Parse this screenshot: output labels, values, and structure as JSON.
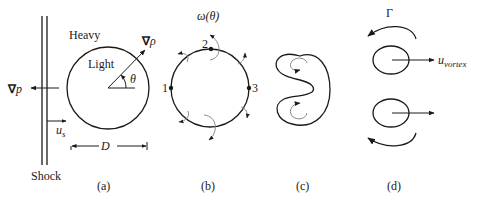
{
  "figure": {
    "panels": [
      {
        "id": "a",
        "label": "(a)"
      },
      {
        "id": "b",
        "label": "(b)"
      },
      {
        "id": "c",
        "label": "(c)"
      },
      {
        "id": "d",
        "label": "(d)"
      }
    ],
    "panel_a": {
      "shock_label": "Shock",
      "heavy_label": "Heavy",
      "light_label": "Light",
      "grad_p_symbol": "∇",
      "grad_p_var": "p",
      "grad_rho_symbol": "∇",
      "grad_rho_var": "ρ",
      "theta_label": "θ",
      "u_s_main": "u",
      "u_s_sub": "s",
      "diameter_label": "D"
    },
    "panel_b": {
      "vorticity_label": "ω(θ)",
      "points": [
        "1",
        "2",
        "3"
      ]
    },
    "panel_d": {
      "circulation_label": "Γ",
      "u_vortex_main": "u",
      "u_vortex_sub": "vortex"
    },
    "colors": {
      "ink": "#1a1a1a",
      "gray_arrow": "#8a8a8a",
      "background": "#ffffff"
    }
  }
}
